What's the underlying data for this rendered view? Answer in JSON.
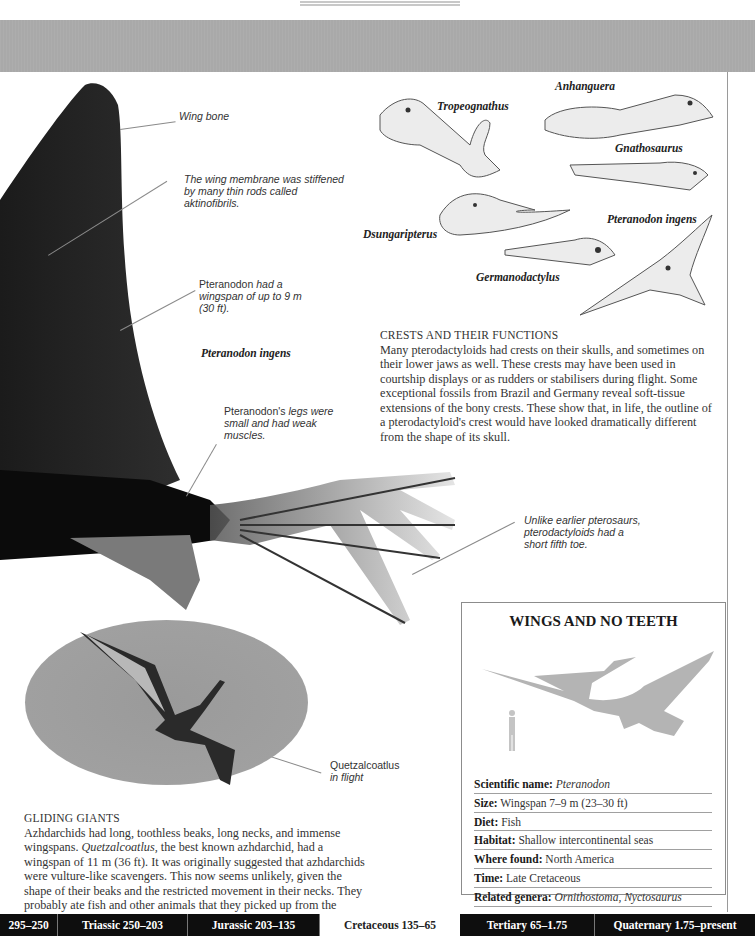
{
  "header": {
    "running_title": "PTERODACTYLOIDS"
  },
  "wing_callouts": {
    "wing_bone": "Wing bone",
    "membrane": "The wing membrane was stiffened by many thin rods called aktinofibrils.",
    "wingspan_name": "Pteranodon",
    "wingspan_rest": " had a wingspan of up to 9 m (30 ft).",
    "species_caption": "Pteranodon ingens",
    "legs_name": "Pteranodon's",
    "legs_rest": " legs were small and had weak muscles.",
    "toe": "Unlike earlier pterosaurs, pterodactyloids had a short fifth toe."
  },
  "skull_labels": [
    "Tropeognathus",
    "Anhanguera",
    "Gnathosaurus",
    "Dsungaripterus",
    "Pteranodon ingens",
    "Germanodactylus"
  ],
  "crests_section": {
    "heading": "CRESTS AND THEIR FUNCTIONS",
    "body": "Many pterodactyloids had crests on their skulls, and sometimes on their lower jaws as well. These crests may have been used in courtship displays or as rudders or stabilisers during flight. Some exceptional fossils from Brazil and Germany reveal soft-tissue extensions of the bony crests. These show that, in life, the outline of a pterodactyloid's crest would have looked dramatically different from the shape of its skull."
  },
  "flight_image": {
    "caption_name": "Quetzalcoatlus",
    "caption_rest": "in flight"
  },
  "gliding_section": {
    "heading": "GLIDING GIANTS",
    "body_1": "Azhdarchids had long, toothless beaks, long necks, and immense wingspans. ",
    "body_italic": "Quetzalcoatlus,",
    "body_2": " the best known azhdarchid, had a wingspan of 11 m (36 ft). It was originally suggested that azhdarchids were vulture-like scavengers. This now seems unlikely, given the shape of their beaks and the restricted movement in their necks. They probably ate fish and other animals that they picked up from the surface of the water or from the ground."
  },
  "factbox": {
    "title": "WINGS AND NO TEETH",
    "rows": [
      {
        "label": "Scientific name:",
        "value": "Pteranodon",
        "italic": true
      },
      {
        "label": "Size:",
        "value": "Wingspan 7–9 m (23–30 ft)",
        "italic": false
      },
      {
        "label": "Diet:",
        "value": "Fish",
        "italic": false
      },
      {
        "label": "Habitat:",
        "value": "Shallow intercontinental seas",
        "italic": false
      },
      {
        "label": "Where found:",
        "value": "North America",
        "italic": false
      },
      {
        "label": "Time:",
        "value": "Late Cretaceous",
        "italic": false
      },
      {
        "label": "Related genera:",
        "value": "Ornithostoma, Nyctosaurus",
        "italic": true
      }
    ]
  },
  "timeline": [
    {
      "label": "295–250",
      "highlight": false
    },
    {
      "label": "Triassic 250–203",
      "highlight": false
    },
    {
      "label": "Jurassic 203–135",
      "highlight": false
    },
    {
      "label": "Cretaceous 135–65",
      "highlight": true
    },
    {
      "label": "Tertiary 65–1.75",
      "highlight": false
    },
    {
      "label": "Quaternary 1.75–present",
      "highlight": false
    }
  ],
  "colors": {
    "band_grey": "#a9a9a9",
    "timeline_dark": "#0e0e0e",
    "silhouette_grey": "#b4b4b4"
  }
}
